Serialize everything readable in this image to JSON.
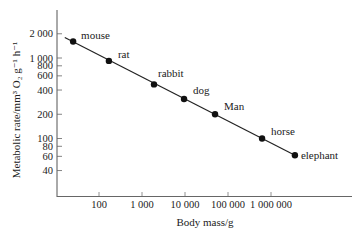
{
  "chart_data": {
    "type": "scatter",
    "scale": {
      "x": "log",
      "y": "log"
    },
    "title": "",
    "xlabel": "Body mass/g",
    "ylabel": "Metabolic rate/mm³ O₂ g⁻¹ h⁻¹",
    "xlim": [
      12,
      30000000
    ],
    "ylim": [
      18,
      3000
    ],
    "x_ticks": [
      {
        "value": 100,
        "label": "100"
      },
      {
        "value": 1000,
        "label": "1 000"
      },
      {
        "value": 10000,
        "label": "10 000"
      },
      {
        "value": 100000,
        "label": "100 000"
      },
      {
        "value": 1000000,
        "label": "1 000 000"
      }
    ],
    "y_ticks": [
      {
        "value": 2000,
        "label": "2 000"
      },
      {
        "value": 1000,
        "label": "1 000"
      },
      {
        "value": 800,
        "label": "800"
      },
      {
        "value": 600,
        "label": "600"
      },
      {
        "value": 400,
        "label": "400"
      },
      {
        "value": 200,
        "label": "200"
      },
      {
        "value": 100,
        "label": "100"
      },
      {
        "value": 80,
        "label": "80"
      },
      {
        "value": 60,
        "label": "60"
      },
      {
        "value": 40,
        "label": "40"
      }
    ],
    "grid": false,
    "legend": null,
    "series": [
      {
        "name": "animals",
        "points": [
          {
            "label": "mouse",
            "x": 25,
            "y": 1600
          },
          {
            "label": "rat",
            "x": 170,
            "y": 920
          },
          {
            "label": "rabbit",
            "x": 1900,
            "y": 470
          },
          {
            "label": "dog",
            "x": 9500,
            "y": 310
          },
          {
            "label": "Man",
            "x": 50000,
            "y": 200
          },
          {
            "label": "horse",
            "x": 620000,
            "y": 100
          },
          {
            "label": "elephant",
            "x": 3600000,
            "y": 62
          }
        ]
      }
    ],
    "fit_line": {
      "from": {
        "x": 16,
        "y": 1800
      },
      "to": {
        "x": 3600000,
        "y": 62
      }
    }
  },
  "colors": {
    "ink": "#1a1a1a",
    "background": "#ffffff"
  }
}
